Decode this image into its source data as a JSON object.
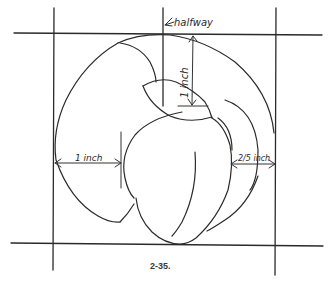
{
  "diagram": {
    "type": "drawing-instruction",
    "labels": {
      "halfway": "halfway",
      "top_depth": "1 inch",
      "left_width": "1 inch",
      "right_width": "2/5 inch"
    },
    "caption": "2-35.",
    "colors": {
      "ink": "#2b2b2b",
      "background": "#ffffff"
    }
  }
}
